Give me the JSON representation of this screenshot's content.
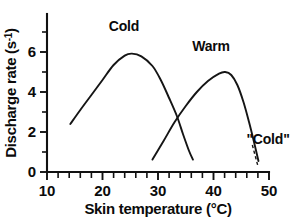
{
  "chart_data": {
    "type": "line",
    "title": "",
    "xlabel": "Skin temperature (°C)",
    "ylabel_prefix": "Discharge rate (s",
    "ylabel_sup": "-1",
    "ylabel_suffix": ")",
    "ylabel": "Discharge rate (s-1)",
    "xlim": [
      10,
      50
    ],
    "ylim": [
      0,
      7
    ],
    "x_ticks_major": [
      10,
      20,
      30,
      40,
      50
    ],
    "x_tick_labels": [
      "10",
      "20",
      "30",
      "40",
      "50"
    ],
    "x_ticks_minor_step": 2,
    "y_ticks_major": [
      0,
      1,
      2,
      3,
      4,
      5,
      6,
      7
    ],
    "y_tick_labels": [
      "0",
      "2",
      "4",
      "6"
    ],
    "y_labeled_values": [
      0,
      2,
      4,
      6
    ],
    "grid": false,
    "legend": "none",
    "axis_color": "#111111",
    "curve_color": "#151515",
    "background": "#ffffff",
    "annotations": [
      {
        "text": "Cold",
        "x": 24.0,
        "y": 6.55,
        "kind": "curve-label"
      },
      {
        "text": "Warm",
        "x": 39.6,
        "y": 5.62,
        "kind": "curve-label"
      },
      {
        "text": "\"Cold\"",
        "x": 47.2,
        "y": 1.62,
        "kind": "annotation-with-leader"
      }
    ],
    "leader_line": {
      "from_x": 47.0,
      "from_y": 1.35,
      "to_x": 48.0,
      "to_y": 0.3,
      "style": "dashed"
    },
    "series": [
      {
        "name": "Cold",
        "label": "Cold",
        "comment": "cold receptor discharge; rises from ~14 C, peaks ~25 C at 5.9 s-1, falls to ~36 C",
        "points": [
          [
            14.2,
            2.4
          ],
          [
            16.0,
            3.1
          ],
          [
            18.0,
            3.85
          ],
          [
            20.0,
            4.6
          ],
          [
            22.0,
            5.35
          ],
          [
            24.0,
            5.82
          ],
          [
            25.3,
            5.92
          ],
          [
            27.0,
            5.78
          ],
          [
            29.0,
            5.3
          ],
          [
            30.5,
            4.6
          ],
          [
            32.0,
            3.7
          ],
          [
            33.4,
            2.8
          ],
          [
            34.5,
            1.9
          ],
          [
            35.6,
            1.05
          ],
          [
            36.3,
            0.62
          ]
        ]
      },
      {
        "name": "Warm",
        "label": "Warm",
        "comment": "warm receptor discharge; rises from ~29 C, peaks ~42 C at 5.0 s-1, falls to ~48 C",
        "points": [
          [
            29.0,
            0.62
          ],
          [
            31.0,
            1.55
          ],
          [
            33.0,
            2.5
          ],
          [
            35.0,
            3.3
          ],
          [
            37.0,
            4.0
          ],
          [
            39.0,
            4.55
          ],
          [
            41.0,
            4.92
          ],
          [
            42.1,
            5.0
          ],
          [
            43.2,
            4.85
          ],
          [
            44.3,
            4.35
          ],
          [
            45.4,
            3.5
          ],
          [
            46.4,
            2.5
          ],
          [
            47.3,
            1.5
          ],
          [
            48.1,
            0.55
          ]
        ]
      }
    ],
    "crossing_point": {
      "x": 33.4,
      "y": 2.8
    }
  }
}
